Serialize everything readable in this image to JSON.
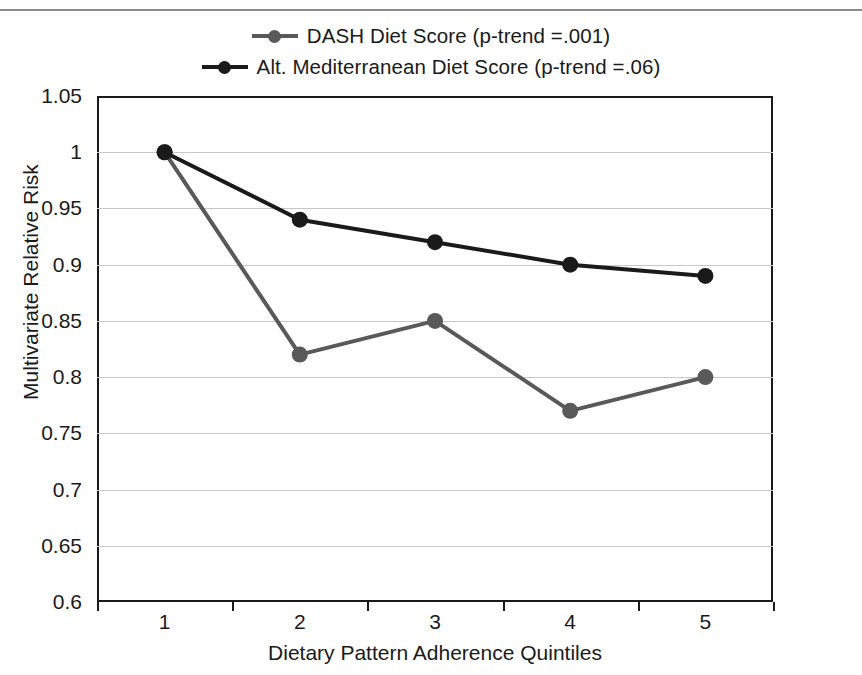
{
  "chart_data": {
    "type": "line",
    "title": "",
    "xlabel": "Dietary Pattern Adherence Quintiles",
    "ylabel": "Multivariate Relative Risk",
    "categories": [
      "1",
      "2",
      "3",
      "4",
      "5"
    ],
    "x": [
      1,
      2,
      3,
      4,
      5
    ],
    "ylim": [
      0.6,
      1.05
    ],
    "ytick_step": 0.05,
    "yticks": [
      "1.05",
      "1",
      "0.95",
      "0.9",
      "0.85",
      "0.8",
      "0.75",
      "0.7",
      "0.65",
      "0.6"
    ],
    "ytick_values": [
      1.05,
      1.0,
      0.95,
      0.9,
      0.85,
      0.8,
      0.75,
      0.7,
      0.65,
      0.6
    ],
    "grid": "horizontal",
    "legend_position": "top-center",
    "series": [
      {
        "name": "DASH Diet Score (p-trend =.001)",
        "short_name": "DASH Diet Score",
        "p_trend": ".001",
        "color": "#595959",
        "marker": "circle",
        "values": [
          1.0,
          0.82,
          0.85,
          0.77,
          0.8
        ]
      },
      {
        "name": "Alt. Mediterranean Diet Score (p-trend =.06)",
        "short_name": "Alt. Mediterranean Diet Score",
        "p_trend": ".06",
        "color": "#1a1a1a",
        "marker": "circle",
        "values": [
          1.0,
          0.94,
          0.92,
          0.9,
          0.89
        ]
      }
    ]
  },
  "style": {
    "background": "#ffffff",
    "frame_color": "#1a1a1a",
    "grid_color": "#c8c8c8",
    "text_color": "#1a1a1a",
    "rule_color": "#8c8c8c"
  }
}
